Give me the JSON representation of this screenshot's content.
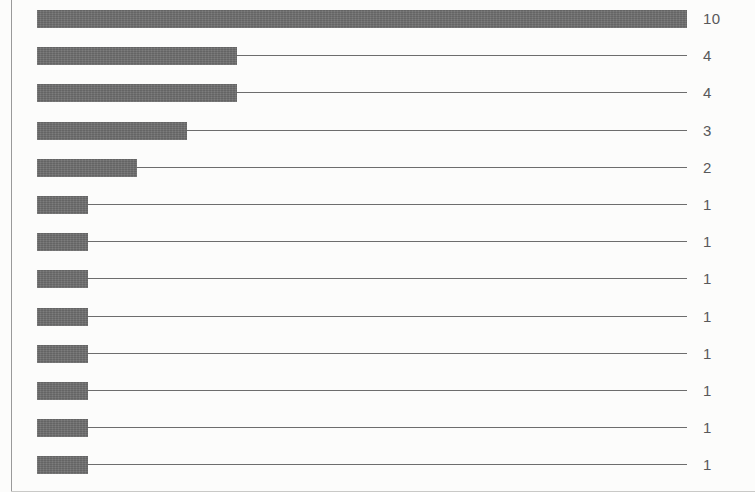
{
  "chart_data": {
    "type": "bar",
    "orientation": "horizontal",
    "title": "",
    "subtitle": "",
    "xlabel": "",
    "ylabel": "",
    "grid": false,
    "legend": null,
    "axis_ticks": [],
    "categories": [
      "",
      "",
      "",
      "",
      "",
      "",
      "",
      "",
      "",
      "",
      "",
      "",
      ""
    ],
    "values": [
      10,
      4,
      4,
      3,
      2,
      1,
      1,
      1,
      1,
      1,
      1,
      1,
      1
    ],
    "value_labels": [
      "10",
      "4",
      "4",
      "3",
      "2",
      "1",
      "1",
      "1",
      "1",
      "1",
      "1",
      "1",
      "1"
    ],
    "bar_pixel_widths": [
      650,
      200,
      200,
      150,
      100,
      51,
      51,
      51,
      51,
      51,
      51,
      51,
      51
    ],
    "xlim": [
      0,
      10
    ],
    "bar_color": "#6e6e6e",
    "leader_line_color": "#6d6d6d",
    "label_color": "#58585a",
    "frame_color": "#9a9a9a",
    "background_color": "#fcfcfb",
    "leader_line_end_x": 650,
    "row_count": 13
  },
  "layout": {
    "bar_left": 37,
    "first_row_top": 10,
    "row_pitch": 37.2,
    "bar_height": 18,
    "label_left": 703
  }
}
